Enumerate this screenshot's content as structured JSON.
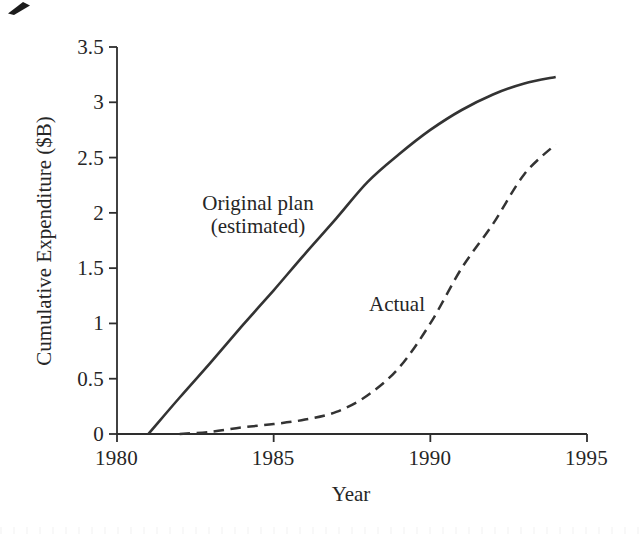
{
  "chart_data": {
    "type": "line",
    "title": "",
    "xlabel": "Year",
    "ylabel": "Cumulative Expenditure ($B)",
    "xlim": [
      1980,
      1995
    ],
    "ylim": [
      0,
      3.5
    ],
    "grid": false,
    "legend_position": "inline-annotations",
    "xticks": [
      1980,
      1985,
      1990,
      1995
    ],
    "yticks": [
      0,
      0.5,
      1,
      1.5,
      2,
      2.5,
      3,
      3.5
    ],
    "xtick_labels": [
      "1980",
      "1985",
      "1990",
      "1995"
    ],
    "ytick_labels": [
      "0",
      "0.5",
      "1",
      "1.5",
      "2",
      "2.5",
      "3",
      "3.5"
    ],
    "line_color": "#333333",
    "series": [
      {
        "name": "Original plan (estimated)",
        "style": "solid",
        "annotation_lines": [
          "Original plan",
          "(estimated)"
        ],
        "x": [
          1981,
          1982,
          1983,
          1984,
          1985,
          1986,
          1987,
          1988,
          1989,
          1990,
          1991,
          1992,
          1993,
          1994
        ],
        "y": [
          0,
          0.33,
          0.65,
          0.98,
          1.3,
          1.63,
          1.95,
          2.28,
          2.53,
          2.75,
          2.93,
          3.07,
          3.17,
          3.23
        ]
      },
      {
        "name": "Actual",
        "style": "dashed",
        "annotation_lines": [
          "Actual"
        ],
        "x": [
          1982,
          1983,
          1984,
          1985,
          1986,
          1987,
          1988,
          1989,
          1990,
          1991,
          1992,
          1993,
          1994
        ],
        "y": [
          0,
          0.02,
          0.06,
          0.09,
          0.13,
          0.2,
          0.35,
          0.6,
          1.0,
          1.5,
          1.9,
          2.35,
          2.62
        ]
      }
    ],
    "artifacts": {
      "top_left_scan_mark": true,
      "bottom_edge_scan_noise": true
    }
  }
}
